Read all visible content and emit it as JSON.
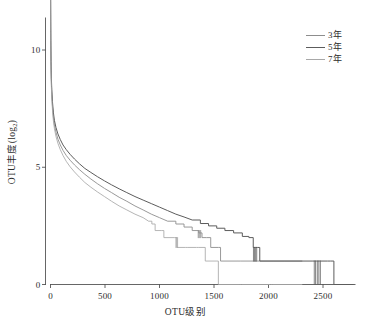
{
  "chart_data": {
    "type": "line",
    "title": "",
    "xlabel": "OTU级别",
    "ylabel": "OTU丰度(log",
    "ylabel_sub": "2",
    "ylabel_suffix": ")",
    "xlim": [
      0,
      2780
    ],
    "ylim": [
      -0.45,
      12.2
    ],
    "xticks": [
      0,
      500,
      1000,
      1500,
      2000,
      2500
    ],
    "xtick_labels": [
      "0",
      "500",
      "1000",
      "1500",
      "2000",
      "2500"
    ],
    "yticks": [
      0,
      5,
      10
    ],
    "ytick_labels": [
      "0",
      "5",
      "10"
    ],
    "grid": false,
    "legend_position": "top-right",
    "series": [
      {
        "name": "3年",
        "color": "#8d8d8d",
        "width": 0.9,
        "points": [
          [
            1,
            12.2
          ],
          [
            2,
            11.0
          ],
          [
            3,
            10.2
          ],
          [
            5,
            9.3
          ],
          [
            8,
            8.6
          ],
          [
            12,
            8.1
          ],
          [
            18,
            7.6
          ],
          [
            26,
            7.15
          ],
          [
            36,
            6.8
          ],
          [
            50,
            6.5
          ],
          [
            68,
            6.2
          ],
          [
            90,
            5.95
          ],
          [
            115,
            5.72
          ],
          [
            145,
            5.5
          ],
          [
            180,
            5.3
          ],
          [
            220,
            5.1
          ],
          [
            265,
            4.9
          ],
          [
            315,
            4.7
          ],
          [
            370,
            4.5
          ],
          [
            430,
            4.3
          ],
          [
            495,
            4.1
          ],
          [
            560,
            3.92
          ],
          [
            630,
            3.72
          ],
          [
            700,
            3.55
          ],
          [
            775,
            3.35
          ],
          [
            850,
            3.18
          ],
          [
            925,
            3.0
          ],
          [
            1000,
            2.85
          ],
          [
            1075,
            2.7
          ],
          [
            1150,
            2.58
          ],
          [
            1225,
            2.45
          ],
          [
            1300,
            2.3
          ],
          [
            1360,
            2.2
          ],
          [
            1390,
            2.0
          ],
          [
            1430,
            2.0
          ],
          [
            1470,
            1.58
          ],
          [
            1540,
            1.58
          ],
          [
            1560,
            1.0
          ],
          [
            1720,
            1.0
          ],
          [
            1740,
            1.0
          ],
          [
            1900,
            1.0
          ],
          [
            1920,
            1.0
          ],
          [
            2050,
            1.0
          ],
          [
            2150,
            1.0
          ],
          [
            2310,
            1.0
          ]
        ]
      },
      {
        "name": "5年",
        "color": "#5c5c5c",
        "width": 1.0,
        "points": [
          [
            1,
            12.2
          ],
          [
            2,
            11.2
          ],
          [
            3,
            10.4
          ],
          [
            5,
            9.5
          ],
          [
            8,
            8.8
          ],
          [
            12,
            8.3
          ],
          [
            18,
            7.8
          ],
          [
            26,
            7.35
          ],
          [
            36,
            7.0
          ],
          [
            50,
            6.7
          ],
          [
            68,
            6.42
          ],
          [
            90,
            6.18
          ],
          [
            115,
            5.95
          ],
          [
            145,
            5.75
          ],
          [
            180,
            5.55
          ],
          [
            220,
            5.35
          ],
          [
            265,
            5.15
          ],
          [
            315,
            4.95
          ],
          [
            370,
            4.78
          ],
          [
            430,
            4.6
          ],
          [
            495,
            4.42
          ],
          [
            560,
            4.25
          ],
          [
            630,
            4.08
          ],
          [
            700,
            3.92
          ],
          [
            775,
            3.75
          ],
          [
            850,
            3.6
          ],
          [
            925,
            3.45
          ],
          [
            1000,
            3.3
          ],
          [
            1075,
            3.15
          ],
          [
            1150,
            3.0
          ],
          [
            1225,
            2.88
          ],
          [
            1300,
            2.75
          ],
          [
            1375,
            2.6
          ],
          [
            1450,
            2.5
          ],
          [
            1525,
            2.4
          ],
          [
            1600,
            2.3
          ],
          [
            1680,
            2.2
          ],
          [
            1760,
            2.05
          ],
          [
            1820,
            2.0
          ],
          [
            1860,
            1.58
          ],
          [
            1880,
            1.58
          ],
          [
            1900,
            1.58
          ],
          [
            1920,
            1.0
          ],
          [
            2400,
            1.0
          ],
          [
            2440,
            1.0
          ],
          [
            2470,
            1.0
          ],
          [
            2500,
            1.0
          ],
          [
            2540,
            1.0
          ],
          [
            2570,
            1.0
          ],
          [
            2600,
            0.0
          ],
          [
            2780,
            0.0
          ]
        ]
      },
      {
        "name": "7年",
        "color": "#a8a8a8",
        "width": 0.85,
        "points": [
          [
            1,
            12.2
          ],
          [
            2,
            10.8
          ],
          [
            3,
            10.0
          ],
          [
            5,
            9.1
          ],
          [
            8,
            8.45
          ],
          [
            12,
            7.95
          ],
          [
            18,
            7.45
          ],
          [
            26,
            7.0
          ],
          [
            36,
            6.65
          ],
          [
            50,
            6.32
          ],
          [
            68,
            6.02
          ],
          [
            90,
            5.75
          ],
          [
            115,
            5.5
          ],
          [
            145,
            5.25
          ],
          [
            180,
            5.02
          ],
          [
            220,
            4.8
          ],
          [
            265,
            4.58
          ],
          [
            315,
            4.35
          ],
          [
            370,
            4.15
          ],
          [
            430,
            3.95
          ],
          [
            495,
            3.75
          ],
          [
            560,
            3.55
          ],
          [
            630,
            3.35
          ],
          [
            700,
            3.18
          ],
          [
            775,
            3.0
          ],
          [
            850,
            2.85
          ],
          [
            900,
            2.7
          ],
          [
            930,
            2.58
          ],
          [
            960,
            2.3
          ],
          [
            1020,
            2.3
          ],
          [
            1040,
            2.0
          ],
          [
            1140,
            2.0
          ],
          [
            1160,
            1.58
          ],
          [
            1240,
            1.58
          ],
          [
            1260,
            1.58
          ],
          [
            1340,
            1.58
          ],
          [
            1360,
            1.58
          ],
          [
            1420,
            1.0
          ],
          [
            1520,
            1.0
          ],
          [
            1540,
            0.0
          ],
          [
            1730,
            0.0
          ],
          [
            1750,
            0.0
          ],
          [
            2020,
            0.0
          ],
          [
            2040,
            0.0
          ],
          [
            2310,
            0.0
          ]
        ]
      }
    ],
    "tail_steps_note": "stepped rarefaction tails"
  },
  "axes": {
    "axis_color": "#555555",
    "tick_length": 3
  },
  "legend": {
    "entries": [
      {
        "label": "3年",
        "color": "#8d8d8d"
      },
      {
        "label": "5年",
        "color": "#5c5c5c"
      },
      {
        "label": "7年",
        "color": "#a8a8a8"
      }
    ]
  }
}
